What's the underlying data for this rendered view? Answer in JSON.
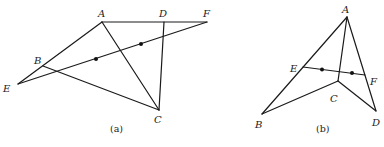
{
  "figures": [
    {
      "caption": "(a)",
      "points": {
        "A": {
          "label": "A",
          "x": 102,
          "y": 22
        },
        "D": {
          "label": "D",
          "x": 164,
          "y": 22
        },
        "F": {
          "label": "F",
          "x": 207,
          "y": 22
        },
        "B": {
          "label": "B",
          "x": 43,
          "y": 66
        },
        "E": {
          "label": "E",
          "x": 18,
          "y": 84
        },
        "C": {
          "label": "C",
          "x": 159,
          "y": 110
        }
      },
      "segments": [
        [
          "A",
          "F"
        ],
        [
          "A",
          "E"
        ],
        [
          "E",
          "F"
        ],
        [
          "A",
          "C"
        ],
        [
          "B",
          "C"
        ],
        [
          "D",
          "C"
        ]
      ],
      "midpoint_dots": [
        {
          "x": 96,
          "y": 59
        },
        {
          "x": 141,
          "y": 44
        }
      ]
    },
    {
      "caption": "(b)",
      "points": {
        "A": {
          "label": "A",
          "x": 347,
          "y": 17
        },
        "B": {
          "label": "B",
          "x": 262,
          "y": 114
        },
        "C": {
          "label": "C",
          "x": 338,
          "y": 81
        },
        "D": {
          "label": "D",
          "x": 376,
          "y": 111
        },
        "E": {
          "label": "E",
          "x": 303,
          "y": 67
        },
        "F": {
          "label": "F",
          "x": 365,
          "y": 75
        }
      },
      "segments": [
        [
          "A",
          "B"
        ],
        [
          "A",
          "D"
        ],
        [
          "A",
          "C"
        ],
        [
          "B",
          "C"
        ],
        [
          "C",
          "D"
        ],
        [
          "E",
          "F"
        ]
      ],
      "midpoint_dots": [
        {
          "x": 322,
          "y": 69
        },
        {
          "x": 352,
          "y": 72
        }
      ]
    }
  ]
}
